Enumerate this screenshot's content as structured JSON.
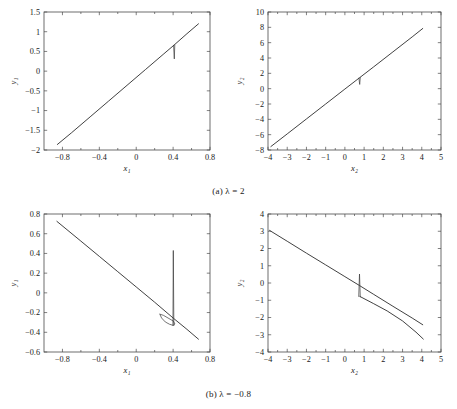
{
  "figure": {
    "captions": [
      {
        "id": "caption-a",
        "text": "(a) λ = 2"
      },
      {
        "id": "caption-b",
        "text": "(b) λ = −0.8"
      }
    ]
  },
  "chart_data": [
    {
      "type": "line",
      "panel": "top-left",
      "title": "",
      "xlabel": "x₁",
      "ylabel": "y₁",
      "xlim": [
        -1.0,
        0.8
      ],
      "ylim": [
        -2,
        1.5
      ],
      "xticks": [
        -0.8,
        -0.4,
        0,
        0.4,
        0.8
      ],
      "xticklabels": [
        "−0.8",
        "−0.4",
        "0",
        "0.4",
        "0.8"
      ],
      "yticks": [
        -2,
        -1.5,
        -1,
        -0.5,
        0,
        0.5,
        1,
        1.5
      ],
      "yticklabels": [
        "−2",
        "−1.5",
        "−1",
        "−0.5",
        "0",
        "0.5",
        "1",
        "1.5"
      ],
      "grid": false,
      "legend": null,
      "series": [
        {
          "name": "trajectory",
          "comment": "near-linear positive slope locus",
          "x": [
            -0.855,
            -0.7,
            -0.5,
            -0.3,
            -0.1,
            0.1,
            0.3,
            0.41,
            0.55,
            0.675
          ],
          "y": [
            -1.86,
            -1.56,
            -1.16,
            -0.76,
            -0.36,
            0.04,
            0.44,
            0.66,
            0.95,
            1.2
          ]
        },
        {
          "name": "spike",
          "comment": "short downward excursion at x ≈ 0.41",
          "x": [
            0.405,
            0.413,
            0.418
          ],
          "y": [
            0.655,
            0.31,
            0.66
          ]
        }
      ]
    },
    {
      "type": "line",
      "panel": "top-right",
      "title": "",
      "xlabel": "x₂",
      "ylabel": "y₂",
      "xlim": [
        -4,
        5
      ],
      "ylim": [
        -8,
        10
      ],
      "xticks": [
        -4,
        -3,
        -2,
        -1,
        0,
        1,
        2,
        3,
        4,
        5
      ],
      "xticklabels": [
        "−4",
        "−3",
        "−2",
        "−1",
        "0",
        "1",
        "2",
        "3",
        "4",
        "5"
      ],
      "yticks": [
        -8,
        -6,
        -4,
        -2,
        0,
        2,
        4,
        6,
        8,
        10
      ],
      "yticklabels": [
        "−8",
        "−6",
        "−4",
        "−2",
        "0",
        "2",
        "4",
        "6",
        "8",
        "10"
      ],
      "grid": false,
      "legend": null,
      "series": [
        {
          "name": "trajectory",
          "comment": "near-linear positive slope locus",
          "x": [
            -3.85,
            -3.0,
            -2.0,
            -1.0,
            0.0,
            0.75,
            1.5,
            2.5,
            3.5,
            4.05
          ],
          "y": [
            -7.55,
            -5.9,
            -3.95,
            -2.0,
            -0.05,
            1.4,
            2.85,
            4.8,
            6.75,
            7.85
          ]
        },
        {
          "name": "spike",
          "comment": "short downward excursion at x ≈ 0.75",
          "x": [
            0.73,
            0.77,
            0.8
          ],
          "y": [
            1.38,
            0.55,
            1.45
          ]
        }
      ]
    },
    {
      "type": "line",
      "panel": "bottom-left",
      "title": "",
      "xlabel": "x₁",
      "ylabel": "y₁",
      "xlim": [
        -1.0,
        0.8
      ],
      "ylim": [
        -0.6,
        0.8
      ],
      "xticks": [
        -0.8,
        -0.4,
        0,
        0.4,
        0.8
      ],
      "xticklabels": [
        "−0.8",
        "−0.4",
        "0",
        "0.4",
        "0.8"
      ],
      "yticks": [
        -0.6,
        -0.4,
        -0.2,
        0,
        0.2,
        0.4,
        0.6,
        0.8
      ],
      "yticklabels": [
        "−0.6",
        "−0.4",
        "−0.2",
        "0",
        "0.2",
        "0.4",
        "0.6",
        "0.8"
      ],
      "grid": false,
      "legend": null,
      "series": [
        {
          "name": "trajectory",
          "comment": "near-linear negative slope locus",
          "x": [
            -0.86,
            -0.6,
            -0.4,
            -0.2,
            0.0,
            0.2,
            0.4,
            0.55,
            0.675
          ],
          "y": [
            0.725,
            0.525,
            0.37,
            0.215,
            0.06,
            -0.095,
            -0.255,
            -0.37,
            -0.47
          ]
        },
        {
          "name": "hook",
          "comment": "small closed loop below the line near x ≈ 0.25–0.42",
          "x": [
            0.255,
            0.275,
            0.315,
            0.36,
            0.4,
            0.42,
            0.4,
            0.345,
            0.295,
            0.262
          ],
          "y": [
            -0.215,
            -0.255,
            -0.295,
            -0.318,
            -0.33,
            -0.315,
            -0.285,
            -0.255,
            -0.228,
            -0.218
          ]
        },
        {
          "name": "spike",
          "comment": "tall thin vertical excursion at x ≈ 0.40",
          "x": [
            0.398,
            0.402,
            0.408
          ],
          "y": [
            -0.33,
            0.43,
            -0.33
          ]
        }
      ]
    },
    {
      "type": "line",
      "panel": "bottom-right",
      "title": "",
      "xlabel": "x₂",
      "ylabel": "y₂",
      "xlim": [
        -4,
        5
      ],
      "ylim": [
        -4,
        4
      ],
      "xticks": [
        -4,
        -3,
        -2,
        -1,
        0,
        1,
        2,
        3,
        4,
        5
      ],
      "xticklabels": [
        "−4",
        "−3",
        "−2",
        "−1",
        "0",
        "1",
        "2",
        "3",
        "4",
        "5"
      ],
      "yticks": [
        -4,
        -3,
        -2,
        -1,
        0,
        1,
        2,
        3,
        4
      ],
      "yticklabels": [
        "−4",
        "−3",
        "−2",
        "−1",
        "0",
        "1",
        "2",
        "3",
        "4"
      ],
      "grid": false,
      "legend": null,
      "series": [
        {
          "name": "trajectory",
          "comment": "near-linear negative slope locus",
          "x": [
            -3.92,
            -3.0,
            -2.0,
            -1.0,
            0.0,
            0.75,
            1.5,
            2.5,
            3.5,
            4.05
          ],
          "y": [
            3.05,
            2.42,
            1.73,
            1.05,
            0.37,
            -0.14,
            -0.66,
            -1.35,
            -2.03,
            -2.42
          ]
        },
        {
          "name": "tail",
          "comment": "slightly steeper lower branch merging with main line",
          "x": [
            0.78,
            1.5,
            2.2,
            3.0,
            3.7,
            4.08
          ],
          "y": [
            -0.78,
            -1.2,
            -1.62,
            -2.2,
            -2.85,
            -3.25
          ]
        },
        {
          "name": "spike",
          "comment": "upward excursion at x ≈ 0.75",
          "x": [
            0.72,
            0.76,
            0.8
          ],
          "y": [
            -0.78,
            0.52,
            -0.8
          ]
        }
      ]
    }
  ]
}
